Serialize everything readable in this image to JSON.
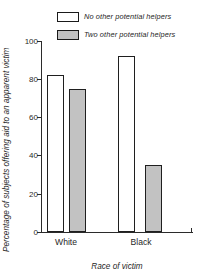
{
  "chart_data": {
    "type": "bar",
    "title": "",
    "subtitle": "",
    "xlabel": "Race of victim",
    "ylabel": "Percentage of subjects offering aid to an apparent victim",
    "categories": [
      "White",
      "Black"
    ],
    "series": [
      {
        "name": "No other potential helpers",
        "values": [
          82,
          92
        ],
        "color": "#ffffff"
      },
      {
        "name": "Two other potential helpers",
        "values": [
          75,
          35
        ],
        "color": "#c2c2c2"
      }
    ],
    "ylim": [
      0,
      100
    ],
    "yticks": [
      0,
      20,
      40,
      60,
      80,
      100
    ],
    "ytick_labels": [
      "0",
      "20",
      "40",
      "60",
      "80",
      "100"
    ],
    "grid": false,
    "legend_position": "top-right"
  },
  "legend": {
    "items": [
      {
        "label": "No other potential helpers",
        "swatch": "white-swatch-icon"
      },
      {
        "label": "Two other potential helpers",
        "swatch": "gray-swatch-icon"
      }
    ]
  },
  "axes": {
    "y_title": "Percentage of subjects offering aid to an apparent victim",
    "x_title": "Race of victim",
    "y_ticks": [
      "100",
      "80",
      "60",
      "40",
      "20",
      "0"
    ],
    "x_categories": [
      "White",
      "Black"
    ]
  }
}
